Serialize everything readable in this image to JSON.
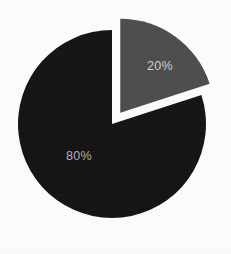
{
  "chart_data": {
    "type": "pie",
    "title": "",
    "subtitle": "",
    "xlabel": "",
    "ylabel": "",
    "legend": "none",
    "grid": false,
    "categories": [
      "Slice A",
      "Slice B"
    ],
    "values": [
      80,
      20
    ],
    "labels": [
      "80%",
      "20%"
    ],
    "slices": [
      {
        "label": "80%",
        "value": 80,
        "percent": 80,
        "color": "#141414",
        "label_color": "#b4b4b4",
        "exploded": false,
        "start_angle_deg": 72,
        "end_angle_deg": 360,
        "sweep_deg": 288,
        "label_x": 79,
        "label_y": 157
      },
      {
        "label": "20%",
        "value": 20,
        "percent": 20,
        "color": "#4d4d4d",
        "label_color": "#d2d2d2",
        "exploded": true,
        "explode_offset_px": 14,
        "start_angle_deg": 0,
        "end_angle_deg": 72,
        "sweep_deg": 72,
        "label_x": 160,
        "label_y": 67
      }
    ],
    "geometry": {
      "center_x": 112,
      "center_y": 124,
      "radius": 94,
      "start_at_12_oclock": true,
      "direction": "clockwise"
    },
    "background_color": "#fdfdfd"
  }
}
